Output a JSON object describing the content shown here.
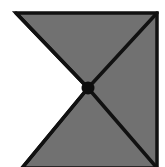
{
  "figure": {
    "canvas": {
      "width": 165,
      "height": 167,
      "background_color": "#ffffff"
    },
    "colors": {
      "fill": "#717171",
      "stroke": "#111111",
      "center_dot": "#0d0d0d",
      "background": "#ffffff"
    },
    "geometry": {
      "stroke_width": 3.5,
      "outline_points": "16,13 157,13 157,168 22,168 88,88",
      "vertices": [
        {
          "name": "top-left-corner",
          "x": 16,
          "y": 13
        },
        {
          "name": "top-right-corner",
          "x": 157,
          "y": 13
        },
        {
          "name": "bottom-right-corner",
          "x": 157,
          "y": 168
        },
        {
          "name": "bottom-left-corner",
          "x": 22,
          "y": 168
        },
        {
          "name": "center-notch-vertex",
          "x": 88,
          "y": 88
        }
      ],
      "diagonals": [
        {
          "name": "diagonal-center-to-top-left",
          "x1": 88,
          "y1": 88,
          "x2": 16,
          "y2": 13
        },
        {
          "name": "diagonal-center-to-top-right",
          "x1": 88,
          "y1": 88,
          "x2": 157,
          "y2": 13
        },
        {
          "name": "diagonal-center-to-bottom-right",
          "x1": 88,
          "y1": 88,
          "x2": 157,
          "y2": 168
        },
        {
          "name": "diagonal-center-to-bottom-left",
          "x1": 88,
          "y1": 88,
          "x2": 22,
          "y2": 168
        }
      ],
      "center_dot": {
        "cx": 88,
        "cy": 88,
        "r": 6.5
      }
    }
  }
}
